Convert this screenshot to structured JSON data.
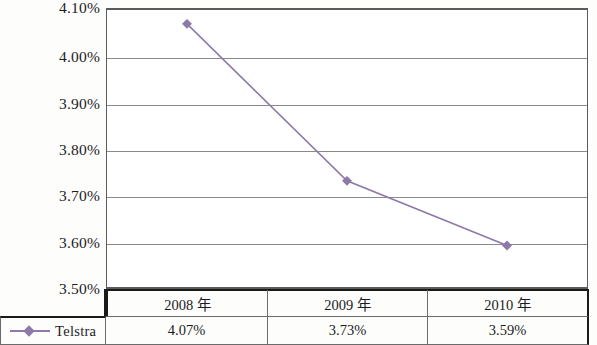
{
  "chart_data": {
    "type": "line",
    "title": "",
    "subtitle": "",
    "xlabel": "",
    "ylabel": "",
    "grid": true,
    "legend_position": "table-bottom-left",
    "categories": [
      "2008 年",
      "2009 年",
      "2010 年"
    ],
    "ytick_labels": [
      "4.10%",
      "4.00%",
      "3.90%",
      "3.80%",
      "3.70%",
      "3.60%",
      "3.50%"
    ],
    "ytick_values": [
      4.1,
      4.0,
      3.9,
      3.8,
      3.7,
      3.6,
      3.5
    ],
    "ylim": [
      3.5,
      4.1
    ],
    "series": [
      {
        "name": "Telstra",
        "color": "#8d7aa8",
        "marker": "diamond",
        "values": [
          4.07,
          3.73,
          3.59
        ],
        "value_labels": [
          "4.07%",
          "3.73%",
          "3.59%"
        ]
      }
    ]
  },
  "table": {
    "legend_header": "",
    "columns": [
      "2008 年",
      "2009 年",
      "2010 年"
    ],
    "rows": [
      {
        "label": "Telstra",
        "marker": "diamond-line-marker",
        "cells": [
          "4.07%",
          "3.73%",
          "3.59%"
        ]
      }
    ]
  },
  "colors": {
    "series": "#8d7aa8",
    "gridline": "#8a8a8a",
    "axis": "#5b5b5b",
    "table_border": "#1a1a1a",
    "text": "#1c1c1c"
  }
}
